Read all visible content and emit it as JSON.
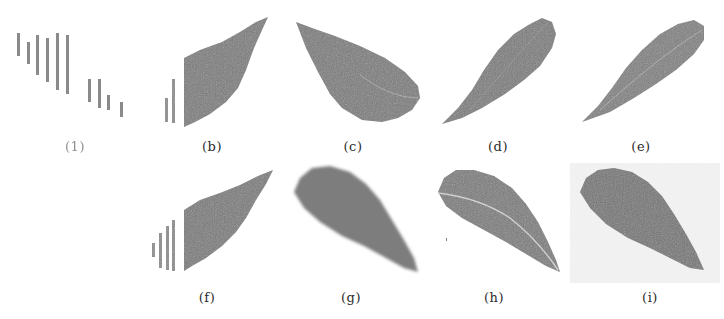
{
  "figure": {
    "leaf_color": "#7b7b7b",
    "bar_color": "#8a8a8a",
    "vein_color": "#d8d8d8",
    "noise_bg_color": "#ececec",
    "panels": [
      {
        "id": "a",
        "label": "(1)",
        "description": "vertical bar segments only"
      },
      {
        "id": "b",
        "label": "(b)",
        "description": "partial leaf with cut left edge and two bars"
      },
      {
        "id": "c",
        "label": "(c)",
        "description": "leaf pointing upper-left"
      },
      {
        "id": "d",
        "label": "(d)",
        "description": "leaf pointing lower-left"
      },
      {
        "id": "e",
        "label": "(e)",
        "description": "leaf pointing lower-left, slightly lighter"
      },
      {
        "id": "f",
        "label": "(f)",
        "description": "partial leaf with cut left edge and four bars"
      },
      {
        "id": "g",
        "label": "(g)",
        "description": "blurred leaf pointing lower-right"
      },
      {
        "id": "h",
        "label": "(h)",
        "description": "leaf with visible midrib pointing lower-right"
      },
      {
        "id": "i",
        "label": "(i)",
        "description": "leaf on noisy background pointing lower-right"
      }
    ]
  }
}
